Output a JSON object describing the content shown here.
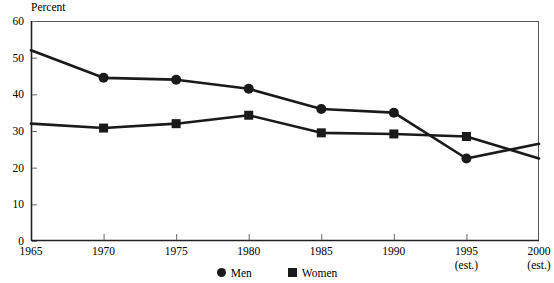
{
  "chart_data": {
    "type": "line",
    "title": "",
    "ylabel": "Percent",
    "xlabel": "",
    "ylim": [
      0,
      60
    ],
    "yticks": [
      0,
      10,
      20,
      30,
      40,
      50,
      60
    ],
    "x": [
      1965,
      1970,
      1975,
      1980,
      1985,
      1990,
      1995,
      2000
    ],
    "xtick_labels": [
      "1965",
      "1970",
      "1975",
      "1980",
      "1985",
      "1990",
      "1995",
      "2000"
    ],
    "xtick_sublabels": [
      "",
      "",
      "",
      "",
      "",
      "",
      "(est.)",
      "(est.)"
    ],
    "grid": false,
    "legend_position": "bottom",
    "series": [
      {
        "name": "Men",
        "marker": "circle",
        "color": "#1a1a1a",
        "values": [
          52,
          44.5,
          44,
          41.5,
          36,
          35,
          22.5,
          26.5
        ],
        "marked_points": [
          false,
          true,
          true,
          true,
          true,
          true,
          true,
          false
        ]
      },
      {
        "name": "Women",
        "marker": "square",
        "color": "#1a1a1a",
        "values": [
          32,
          30.8,
          32,
          34.3,
          29.5,
          29.2,
          28.5,
          22.5
        ],
        "marked_points": [
          false,
          true,
          true,
          true,
          true,
          true,
          true,
          false
        ]
      }
    ]
  },
  "legend": {
    "entries": [
      {
        "label": "Men",
        "marker": "circle"
      },
      {
        "label": "Women",
        "marker": "square"
      }
    ]
  },
  "axis": {
    "y_top_label": "Percent"
  }
}
